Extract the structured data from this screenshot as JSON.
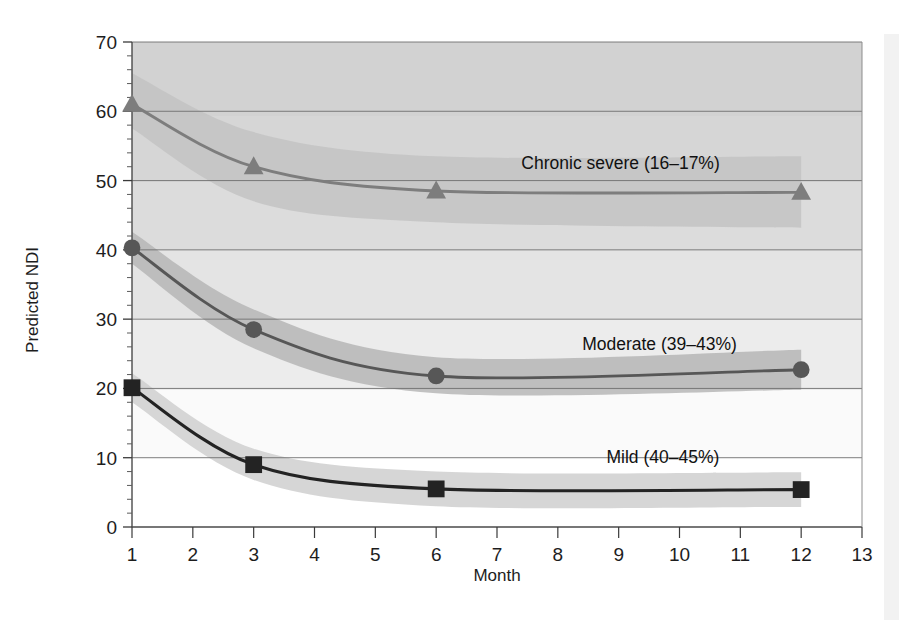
{
  "figure": {
    "background_color": "#ffffff",
    "plot_area": {
      "x0": 132,
      "x1": 862,
      "y_top": 42,
      "y_bottom": 527
    }
  },
  "chart_data": {
    "type": "line",
    "title": "",
    "subtitle": "",
    "xlabel": "Month",
    "ylabel": "Predicted NDI",
    "xlim": [
      1,
      13
    ],
    "ylim": [
      0,
      70
    ],
    "xticks": [
      1,
      2,
      3,
      4,
      5,
      6,
      7,
      8,
      9,
      10,
      11,
      12,
      13
    ],
    "xtick_labels": [
      "1",
      "2",
      "3",
      "4",
      "5",
      "6",
      "7",
      "8",
      "9",
      "10",
      "11",
      "12",
      "13"
    ],
    "yticks": [
      0,
      10,
      20,
      30,
      40,
      50,
      60,
      70
    ],
    "ytick_labels": [
      "0",
      "10",
      "20",
      "30",
      "40",
      "50",
      "60",
      "70"
    ],
    "y_minor_tick_step": 2,
    "grid": "horizontal-only",
    "legend_position": "inline-annotations",
    "x": [
      1,
      3,
      6,
      12
    ],
    "series": [
      {
        "name": "Chronic severe (16–17%)",
        "label": "Chronic severe (16–17%)",
        "marker": "triangle",
        "color": "#7d7d7d",
        "band_color": "#c3c3c3",
        "values": [
          61.0,
          52.0,
          48.5,
          48.3
        ],
        "ci_lower": [
          57.5,
          47.0,
          44.0,
          43.2
        ],
        "ci_upper": [
          65.5,
          57.0,
          53.5,
          53.5
        ],
        "label_x": 7.4,
        "label_y": 51.6
      },
      {
        "name": "Moderate (39–43%)",
        "label": "Moderate (39–43%)",
        "marker": "circle",
        "color": "#575757",
        "band_color": "#b6b6b6",
        "values": [
          40.3,
          28.5,
          21.8,
          22.7
        ],
        "ci_lower": [
          38.0,
          25.8,
          19.3,
          19.8
        ],
        "ci_upper": [
          42.6,
          31.4,
          24.5,
          25.6
        ],
        "label_x": 8.4,
        "label_y": 25.5
      },
      {
        "name": "Mild (40–45%)",
        "label": "Mild (40–45%)",
        "marker": "square",
        "color": "#232323",
        "band_color": "#cfcfcf",
        "values": [
          20.1,
          9.0,
          5.5,
          5.4
        ],
        "ci_lower": [
          18.0,
          6.8,
          3.0,
          2.9
        ],
        "ci_upper": [
          22.2,
          11.3,
          8.0,
          7.9
        ],
        "label_x": 8.8,
        "label_y": 9.2
      }
    ]
  },
  "annotations": {
    "chronic_severe": "Chronic severe (16–17%)",
    "moderate": "Moderate (39–43%)",
    "mild": "Mild (40–45%)"
  }
}
